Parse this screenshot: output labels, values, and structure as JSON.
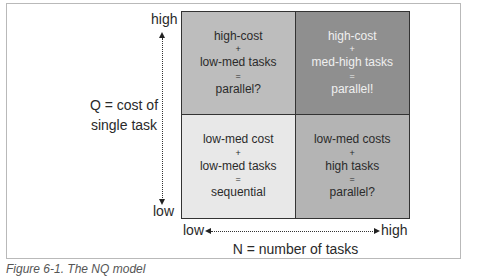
{
  "diagram": {
    "y_axis": {
      "title_line1": "Q = cost of",
      "title_line2": "single task",
      "high_label": "high",
      "low_label": "low"
    },
    "x_axis": {
      "title": "N = number of tasks",
      "low_label": "low",
      "high_label": "high"
    },
    "quadrants": {
      "top_left": {
        "line1": "high-cost",
        "op1": "+",
        "line2": "low-med tasks",
        "op2": "=",
        "result": "parallel?",
        "color": "#bdbdbd"
      },
      "top_right": {
        "line1": "high-cost",
        "op1": "+",
        "line2": "med-high tasks",
        "op2": "=",
        "result": "parallel!",
        "color": "#8f8f8f"
      },
      "bottom_left": {
        "line1": "low-med cost",
        "op1": "+",
        "line2": "low-med tasks",
        "op2": "=",
        "result": "sequential",
        "color": "#e8e8e8"
      },
      "bottom_right": {
        "line1": "low-med costs",
        "op1": "+",
        "line2": "high tasks",
        "op2": "=",
        "result": "parallel?",
        "color": "#b4b4b4"
      }
    },
    "caption": "Figure 6-1. The NQ model"
  }
}
